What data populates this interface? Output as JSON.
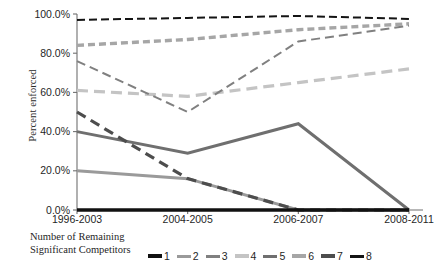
{
  "chart_data": {
    "type": "line",
    "title": "",
    "xlabel": "",
    "ylabel": "Percent enforced",
    "categories": [
      "1996-2003",
      "2004-2005",
      "2006-2007",
      "2008-2011"
    ],
    "ylim": [
      0,
      100
    ],
    "yticks": [
      "0.0%",
      "20.0%",
      "40.0%",
      "60.0%",
      "80.0%",
      "100.0%"
    ],
    "ytick_values": [
      0,
      20,
      40,
      60,
      80,
      100
    ],
    "grid": false,
    "legend_position": "bottom",
    "legend_title": "Number of Remaining Significant Competitors",
    "series": [
      {
        "name": "1",
        "values": [
          0,
          0,
          0,
          0
        ],
        "color": "#111111",
        "style": "solid",
        "width": 3.4,
        "dash": ""
      },
      {
        "name": "2",
        "values": [
          20,
          16,
          0,
          0
        ],
        "color": "#9a9a9a",
        "style": "solid",
        "width": 3.0,
        "dash": ""
      },
      {
        "name": "3",
        "values": [
          76,
          50,
          86,
          94
        ],
        "color": "#808080",
        "style": "dashed",
        "width": 2.0,
        "dash": "9,5"
      },
      {
        "name": "4",
        "values": [
          61,
          58,
          65,
          72
        ],
        "color": "#c4c4c4",
        "style": "dashed",
        "width": 3.2,
        "dash": "11,6"
      },
      {
        "name": "5",
        "values": [
          40,
          29,
          44,
          0
        ],
        "color": "#6f6f6f",
        "style": "solid",
        "width": 3.0,
        "dash": ""
      },
      {
        "name": "6",
        "values": [
          84,
          87,
          92,
          95
        ],
        "color": "#a6a6a6",
        "style": "dashed",
        "width": 3.4,
        "dash": "7,4"
      },
      {
        "name": "7",
        "values": [
          50,
          16,
          0,
          0
        ],
        "color": "#4d4d4d",
        "style": "dashed",
        "width": 3.2,
        "dash": "10,6"
      },
      {
        "name": "8",
        "values": [
          97,
          98,
          99,
          97.5
        ],
        "color": "#141414",
        "style": "dashed",
        "width": 2.0,
        "dash": "8,4"
      }
    ]
  },
  "axis": {
    "y_title": "Percent enforced"
  },
  "legend": {
    "title_line1": "Number of Remaining",
    "title_line2": "Significant Competitors"
  }
}
